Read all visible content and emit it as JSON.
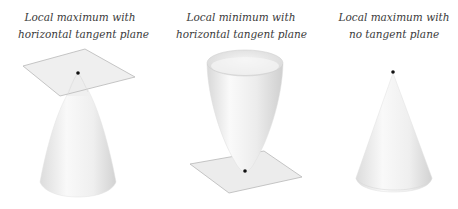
{
  "panels": [
    {
      "id": "local-max-horizontal",
      "caption": [
        "Local maximum with",
        "horizontal tangent plane"
      ]
    },
    {
      "id": "local-min-horizontal",
      "caption": [
        "Local minimum with",
        "horizontal tangent plane"
      ]
    },
    {
      "id": "local-max-no-tangent",
      "caption": [
        "Local maximum with",
        "no tangent plane"
      ]
    }
  ],
  "colors": {
    "surface_light": "#f7f7f7",
    "surface_shade": "#d6d6d6",
    "plane_fill": "#ececec",
    "plane_edge": "#b8b8b8",
    "point": "#111111",
    "text": "#3a3a3a"
  }
}
